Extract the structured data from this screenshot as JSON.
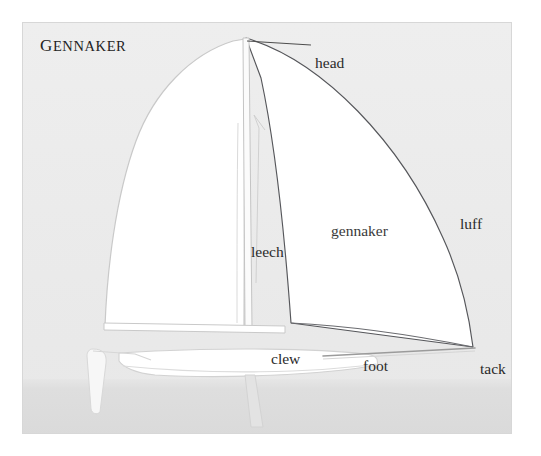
{
  "figure": {
    "caption": "Gennaker",
    "caption_first_letter": "G",
    "caption_rest": "ENNAKER",
    "colors": {
      "sky": "#ececec",
      "sea": "#dcdcdc",
      "sail_fill": "#ffffff",
      "outline_dark": "#55565a",
      "outline_light": "#c9c9c9",
      "text": "#2a2a2a",
      "frame_border": "#d7d7d7"
    }
  },
  "labels": {
    "head": "head",
    "luff": "luff",
    "gennaker": "gennaker",
    "leech": "leech",
    "clew": "clew",
    "foot": "foot",
    "tack": "tack"
  },
  "parts": {
    "mainsail": "mainsail",
    "gennaker_sail": "gennaker-sail",
    "mast": "mast",
    "boom": "boom",
    "hull": "hull",
    "bowsprit": "bowsprit",
    "rudder": "rudder",
    "daggerboard": "daggerboard",
    "leader_head": "head-leader-line"
  }
}
